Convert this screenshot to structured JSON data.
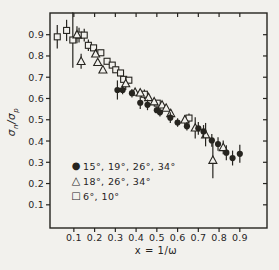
{
  "colors": {
    "ink": "#26241f",
    "background": "#f2f1ed"
  },
  "chart_data": {
    "type": "scatter",
    "title": "",
    "xlabel": "x = 1/ω",
    "ylabel": "σn/σp",
    "ylabel_parts": {
      "num_base": "σ",
      "num_sub": "n",
      "slash": "/",
      "den_base": "σ",
      "den_sub": "p"
    },
    "xlim": [
      -0.015,
      1.031
    ],
    "ylim": [
      -0.009,
      1.002
    ],
    "grid": false,
    "legend_position": "lower-left-inside",
    "x_ticks": {
      "values": [
        0.1,
        0.2,
        0.3,
        0.4,
        0.5,
        0.6,
        0.7,
        0.8,
        0.9
      ],
      "labels": [
        "0.1",
        "0.2",
        "0.3",
        "0.4",
        "0.5",
        "0.6",
        "0.7",
        "0.8",
        "0.9"
      ]
    },
    "y_ticks": {
      "values": [
        0.1,
        0.2,
        0.3,
        0.4,
        0.5,
        0.6,
        0.7,
        0.8,
        0.9
      ],
      "labels": [
        "0.1",
        "0.2",
        "0.3",
        "0.4",
        "0.5",
        "0.6",
        "0.7",
        "0.8",
        "0.9"
      ]
    },
    "series": [
      {
        "name": "squares-6-10-deg",
        "label": "6°, 10°",
        "marker": "square-open",
        "glyph": "□",
        "points": [
          [
            0.02,
            0.89,
            0.055
          ],
          [
            0.065,
            0.92,
            0.05
          ],
          [
            0.095,
            0.875,
            0.13
          ],
          [
            0.125,
            0.898,
            0.035
          ],
          [
            0.15,
            0.898,
            0.03
          ],
          [
            0.17,
            0.85,
            0.027
          ],
          [
            0.195,
            0.838,
            0
          ],
          [
            0.23,
            0.815,
            0
          ],
          [
            0.26,
            0.775,
            0
          ],
          [
            0.285,
            0.757,
            0
          ],
          [
            0.302,
            0.735,
            0
          ],
          [
            0.325,
            0.72,
            0
          ],
          [
            0.34,
            0.69,
            0
          ],
          [
            0.365,
            0.686,
            0
          ],
          [
            0.44,
            0.62,
            0.022
          ],
          [
            0.502,
            0.578,
            0
          ],
          [
            0.655,
            0.508,
            0.022
          ]
        ]
      },
      {
        "name": "triangles-18-26-34-deg",
        "label": "18°, 26°, 34°",
        "marker": "triangle-open",
        "glyph": "△",
        "points": [
          [
            0.115,
            0.9,
            0.04
          ],
          [
            0.135,
            0.775,
            0.035
          ],
          [
            0.205,
            0.81,
            0
          ],
          [
            0.215,
            0.77,
            0
          ],
          [
            0.24,
            0.735,
            0
          ],
          [
            0.35,
            0.67,
            0.03
          ],
          [
            0.395,
            0.63,
            0
          ],
          [
            0.42,
            0.627,
            0
          ],
          [
            0.46,
            0.605,
            0
          ],
          [
            0.487,
            0.585,
            0
          ],
          [
            0.525,
            0.57,
            0
          ],
          [
            0.545,
            0.555,
            0
          ],
          [
            0.567,
            0.53,
            0
          ],
          [
            0.635,
            0.5,
            0.022
          ],
          [
            0.685,
            0.462,
            0.05
          ],
          [
            0.735,
            0.43,
            0.055
          ],
          [
            0.77,
            0.31,
            0.085
          ],
          [
            0.82,
            0.37,
            0.032
          ]
        ]
      },
      {
        "name": "circles-15-19-26-34-deg",
        "label": "15°, 19°, 26°, 34°",
        "marker": "circle-filled",
        "glyph": "●",
        "points": [
          [
            0.31,
            0.64,
            0.045
          ],
          [
            0.335,
            0.64,
            0.02
          ],
          [
            0.38,
            0.625,
            0.02
          ],
          [
            0.42,
            0.58,
            0.03
          ],
          [
            0.455,
            0.57,
            0.025
          ],
          [
            0.5,
            0.545,
            0
          ],
          [
            0.515,
            0.535,
            0.02
          ],
          [
            0.565,
            0.51,
            0.025
          ],
          [
            0.6,
            0.487,
            0.02
          ],
          [
            0.645,
            0.47,
            0.02
          ],
          [
            0.7,
            0.46,
            0.03
          ],
          [
            0.725,
            0.445,
            0.03
          ],
          [
            0.765,
            0.403,
            0.03
          ],
          [
            0.795,
            0.386,
            0.032
          ],
          [
            0.835,
            0.345,
            0.035
          ],
          [
            0.865,
            0.32,
            0.035
          ],
          [
            0.9,
            0.34,
            0.042
          ]
        ]
      }
    ],
    "legend_order": [
      "circles-15-19-26-34-deg",
      "triangles-18-26-34-deg",
      "squares-6-10-deg"
    ]
  },
  "legend": {
    "items": [
      {
        "glyph": "●",
        "label": "15°, 19°, 26°, 34°"
      },
      {
        "glyph": "△",
        "label": "18°, 26°, 34°"
      },
      {
        "glyph": "□",
        "label": "6°, 10°"
      }
    ]
  }
}
